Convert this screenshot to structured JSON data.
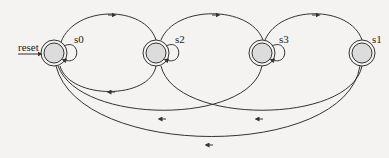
{
  "diagram": {
    "type": "finite-state-machine",
    "initial_label": "reset",
    "colors": {
      "stroke": "#333333",
      "node_fill": "#dcdcdc",
      "background": "#f4f3f1"
    },
    "states": [
      {
        "id": "s0",
        "label": "s0",
        "self_loop": true,
        "initial": true
      },
      {
        "id": "s2",
        "label": "s2",
        "self_loop": true
      },
      {
        "id": "s3",
        "label": "s3",
        "self_loop": true
      },
      {
        "id": "s1",
        "label": "s1",
        "self_loop": false
      }
    ],
    "transitions": [
      {
        "from": "s0",
        "to": "s0"
      },
      {
        "from": "s2",
        "to": "s2"
      },
      {
        "from": "s3",
        "to": "s3"
      },
      {
        "from": "s0",
        "to": "s2"
      },
      {
        "from": "s2",
        "to": "s3"
      },
      {
        "from": "s3",
        "to": "s1"
      },
      {
        "from": "s2",
        "to": "s0"
      },
      {
        "from": "s3",
        "to": "s0"
      },
      {
        "from": "s1",
        "to": "s2"
      },
      {
        "from": "s1",
        "to": "s0"
      }
    ]
  }
}
